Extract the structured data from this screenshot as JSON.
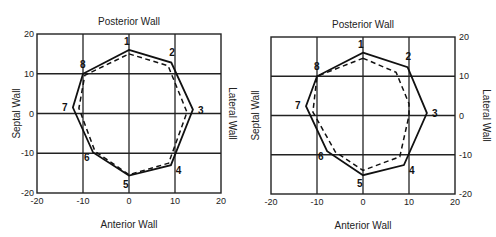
{
  "chart_data": [
    {
      "type": "scatter",
      "subtype": "closed-polygon",
      "title": "",
      "top_label": "Posterior Wall",
      "bottom_label": "Anterior Wall",
      "left_label": "Septal Wall",
      "right_label": "Lateral Wall",
      "xlim": [
        -20,
        20
      ],
      "ylim": [
        -20,
        20
      ],
      "xticks": [
        "-20",
        "-10",
        "0",
        "10",
        "20"
      ],
      "yticks": [
        "20",
        "10",
        "0",
        "-10",
        "-20"
      ],
      "ytick_side": "left",
      "grid": true,
      "series": [
        {
          "name": "solid",
          "style": "solid",
          "points": [
            {
              "label": "1",
              "x": 0,
              "y": 16
            },
            {
              "label": "2",
              "x": 9.2,
              "y": 12.8
            },
            {
              "label": "3",
              "x": 13.9,
              "y": 1
            },
            {
              "label": "4",
              "x": 9.1,
              "y": -13
            },
            {
              "label": "5",
              "x": 0,
              "y": -15.6
            },
            {
              "label": "6",
              "x": -7.8,
              "y": -9.8
            },
            {
              "label": "7",
              "x": -12.2,
              "y": 1.5
            },
            {
              "label": "8",
              "x": -10,
              "y": 10
            }
          ]
        },
        {
          "name": "dashed",
          "style": "dashed",
          "points": [
            {
              "x": 0,
              "y": 15
            },
            {
              "x": 8.5,
              "y": 12
            },
            {
              "x": 12.6,
              "y": 0.3
            },
            {
              "x": 8.6,
              "y": -12.5
            },
            {
              "x": 0,
              "y": -15.4
            },
            {
              "x": -7.4,
              "y": -9.5
            },
            {
              "x": -10.9,
              "y": 1.3
            },
            {
              "x": -9.6,
              "y": 9.6
            }
          ]
        }
      ]
    },
    {
      "type": "scatter",
      "subtype": "closed-polygon",
      "title": "",
      "top_label": "Posterior Wall",
      "bottom_label": "Anterior Wall",
      "left_label": "Septal Wall",
      "right_label": "Lateral Wall",
      "xlim": [
        -20,
        20
      ],
      "ylim": [
        -20,
        20
      ],
      "xticks": [
        "-20",
        "-10",
        "0",
        "10",
        "20"
      ],
      "yticks": [
        "20",
        "10",
        "0",
        "-10",
        "-20"
      ],
      "ytick_side": "right",
      "grid": true,
      "series": [
        {
          "name": "solid",
          "style": "solid",
          "points": [
            {
              "label": "1",
              "x": 0,
              "y": 16
            },
            {
              "label": "2",
              "x": 9.7,
              "y": 12.3
            },
            {
              "label": "3",
              "x": 13.9,
              "y": 0.6
            },
            {
              "label": "4",
              "x": 8.9,
              "y": -12.6
            },
            {
              "label": "5",
              "x": 0,
              "y": -15.2
            },
            {
              "label": "6",
              "x": -7.8,
              "y": -9.1
            },
            {
              "label": "7",
              "x": -12.4,
              "y": 2.4
            },
            {
              "label": "8",
              "x": -10,
              "y": 10
            }
          ]
        },
        {
          "name": "dashed",
          "style": "dashed",
          "points": [
            {
              "x": 0,
              "y": 14.6
            },
            {
              "x": 7.2,
              "y": 11
            },
            {
              "x": 10,
              "y": 3
            },
            {
              "x": 10,
              "y": 0
            },
            {
              "x": 8,
              "y": -10.5
            },
            {
              "x": 0,
              "y": -14
            },
            {
              "x": -6,
              "y": -9.3
            },
            {
              "x": -10.9,
              "y": 0.9
            },
            {
              "x": -10,
              "y": 10
            }
          ]
        }
      ]
    }
  ],
  "layout": {
    "panels": [
      {
        "left": 37,
        "right": 221,
        "top": 34,
        "bottom": 193
      },
      {
        "left": 271,
        "right": 455,
        "top": 37,
        "bottom": 194
      }
    ],
    "label_offsets": {
      "1": [
        -5,
        -5
      ],
      "2": [
        -2,
        -7
      ],
      "3": [
        5,
        4
      ],
      "4": [
        5,
        9
      ],
      "5": [
        -6,
        12
      ],
      "6": [
        -9,
        9
      ],
      "7": [
        -11,
        3
      ],
      "8": [
        -3,
        -6
      ]
    }
  }
}
